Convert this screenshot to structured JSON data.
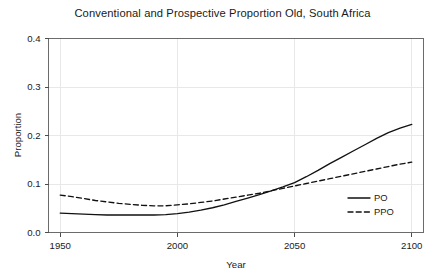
{
  "chart_data": {
    "type": "line",
    "title": "Conventional and Prospective Proportion Old, South Africa",
    "xlabel": "Year",
    "ylabel": "Proportion",
    "xlim": [
      1945,
      2105
    ],
    "ylim": [
      0.0,
      0.4
    ],
    "xticks": [
      1950,
      2000,
      2050,
      2100
    ],
    "xticklabels": [
      "1950",
      "2000",
      "2050",
      "2100"
    ],
    "yticks": [
      0.0,
      0.1,
      0.2,
      0.3,
      0.4
    ],
    "yticklabels": [
      "0.0",
      "0.1",
      "0.2",
      "0.3",
      "0.4"
    ],
    "grid": true,
    "legend_position": "bottom-right",
    "x": [
      1950,
      1955,
      1960,
      1965,
      1970,
      1975,
      1980,
      1985,
      1990,
      1995,
      2000,
      2005,
      2010,
      2015,
      2020,
      2025,
      2030,
      2035,
      2040,
      2045,
      2050,
      2055,
      2060,
      2065,
      2070,
      2075,
      2080,
      2085,
      2090,
      2095,
      2100
    ],
    "series": [
      {
        "name": "PO",
        "style": "solid",
        "color": "#111111",
        "values": [
          0.04,
          0.039,
          0.038,
          0.037,
          0.036,
          0.036,
          0.036,
          0.036,
          0.036,
          0.037,
          0.039,
          0.042,
          0.046,
          0.051,
          0.057,
          0.064,
          0.071,
          0.078,
          0.086,
          0.094,
          0.103,
          0.115,
          0.128,
          0.142,
          0.155,
          0.168,
          0.181,
          0.194,
          0.206,
          0.215,
          0.223
        ]
      },
      {
        "name": "PPO",
        "style": "dashed",
        "color": "#111111",
        "values": [
          0.077,
          0.074,
          0.07,
          0.066,
          0.063,
          0.06,
          0.058,
          0.056,
          0.055,
          0.055,
          0.057,
          0.059,
          0.062,
          0.065,
          0.069,
          0.073,
          0.077,
          0.081,
          0.086,
          0.091,
          0.096,
          0.101,
          0.106,
          0.111,
          0.116,
          0.121,
          0.126,
          0.131,
          0.136,
          0.141,
          0.145
        ]
      }
    ]
  },
  "legend": {
    "entries": [
      {
        "label": "PO",
        "style": "solid"
      },
      {
        "label": "PPO",
        "style": "dashed"
      }
    ]
  }
}
